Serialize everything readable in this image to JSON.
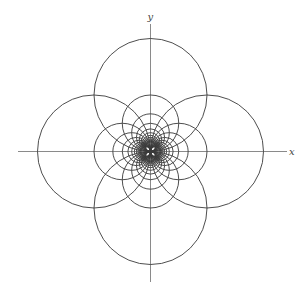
{
  "figure": {
    "origin": {
      "x": 150.5,
      "y": 151.5
    },
    "base_radius": 56.5,
    "n_values": [
      1,
      2,
      3,
      4,
      5,
      6,
      7,
      8,
      9,
      10,
      11,
      12
    ],
    "directions": [
      "up",
      "down",
      "left",
      "right"
    ],
    "stroke_color": "#3a3a3a",
    "axis_color": "#8a8a8a",
    "axes": {
      "x": {
        "label": "x",
        "from": 18,
        "to": 287
      },
      "y": {
        "label": "y",
        "from": 24,
        "to": 282
      }
    }
  }
}
